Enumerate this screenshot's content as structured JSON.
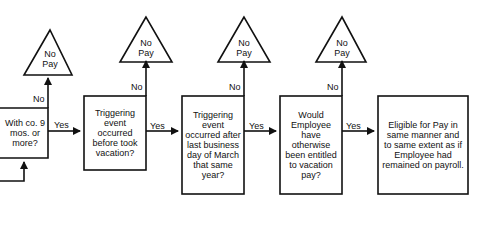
{
  "flowchart": {
    "nodes": [
      {
        "id": "tenure",
        "text": "With co. 9 mos. or more?"
      },
      {
        "id": "trigger-before",
        "text": "Triggering event occurred before took vacation?"
      },
      {
        "id": "trigger-after-march",
        "text": "Triggering event occurred after last business day of March that same year?"
      },
      {
        "id": "entitled",
        "text": "Would Employee have otherwise been entitled to vacation pay?"
      },
      {
        "id": "eligible",
        "text": "Eligible for Pay in same manner and to same extent as if Employee had remained on payroll."
      }
    ],
    "terminals": [
      {
        "id": "no-pay-1",
        "line1": "No",
        "line2": "Pay"
      },
      {
        "id": "no-pay-2",
        "line1": "No",
        "line2": "Pay"
      },
      {
        "id": "no-pay-3",
        "line1": "No",
        "line2": "Pay"
      },
      {
        "id": "no-pay-4",
        "line1": "No",
        "line2": "Pay"
      }
    ],
    "edge_labels": {
      "yes": "Yes",
      "no": "No"
    }
  }
}
